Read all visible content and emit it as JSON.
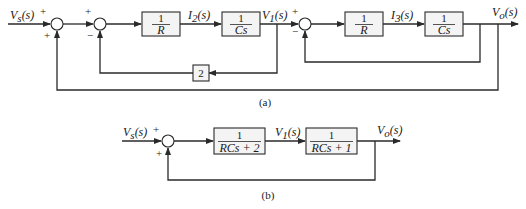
{
  "diagram_a": {
    "caption": "(a)",
    "input_label": "Vs(s)",
    "input_main": "V",
    "input_sub": "s",
    "input_arg": "(s)",
    "summer1": {
      "sign_top": "+",
      "sign_bottom": "+"
    },
    "summer2": {
      "sign_top": "+",
      "sign_bottom": "−"
    },
    "summer3": {
      "sign_top": "+",
      "sign_bottom": "−"
    },
    "block_r1": {
      "num": "1",
      "den": "R"
    },
    "signal_i2": {
      "main": "I",
      "sub": "2",
      "arg": "(s)"
    },
    "block_cs1": {
      "num": "1",
      "den": "Cs"
    },
    "signal_v1": {
      "main": "V",
      "sub": "1",
      "arg": "(s)"
    },
    "block_gain": {
      "value": "2"
    },
    "block_r2": {
      "num": "1",
      "den": "R"
    },
    "signal_i3": {
      "main": "I",
      "sub": "3",
      "arg": "(s)"
    },
    "block_cs2": {
      "num": "1",
      "den": "Cs"
    },
    "output": {
      "main": "V",
      "sub": "o",
      "arg": "(s)"
    }
  },
  "diagram_b": {
    "caption": "(b)",
    "input": {
      "main": "V",
      "sub": "s",
      "arg": "(s)"
    },
    "summer": {
      "sign_top": "+",
      "sign_bottom": "+"
    },
    "block1": {
      "num": "1",
      "den": "RCs + 2"
    },
    "signal_v1": {
      "main": "V",
      "sub": "1",
      "arg": "(s)"
    },
    "block2": {
      "num": "1",
      "den": "RCs + 1"
    },
    "output": {
      "main": "V",
      "sub": "o",
      "arg": "(s)"
    }
  }
}
